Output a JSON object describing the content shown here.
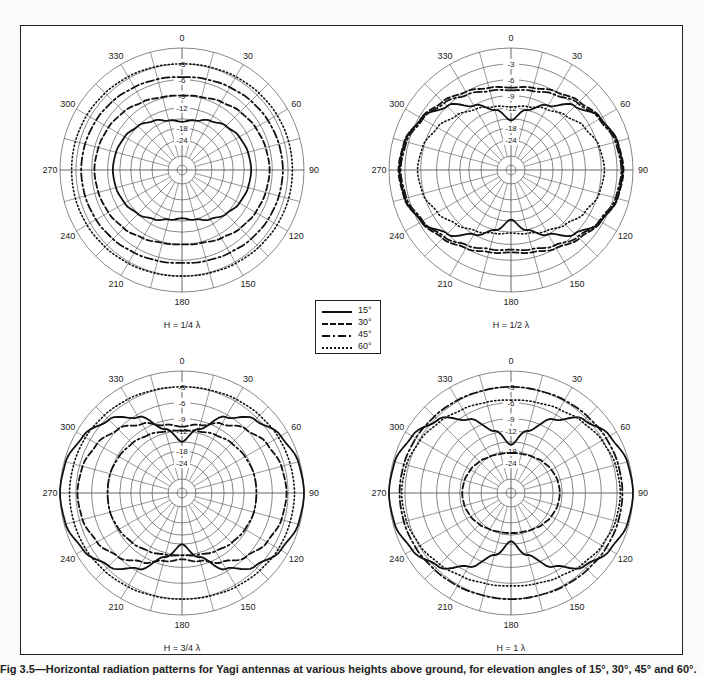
{
  "figure": {
    "caption": "Fig 3.5—Horizontal radiation patterns for Yagi antennas at various heights above ground, for elevation angles of 15°, 30°, 45° and 60°."
  },
  "legend": {
    "items": [
      {
        "label": "15°",
        "style": "solid"
      },
      {
        "label": "30°",
        "style": "dashed"
      },
      {
        "label": "45°",
        "style": "dashdot"
      },
      {
        "label": "60°",
        "style": "dotted"
      }
    ]
  },
  "axes": {
    "angle_labels": [
      "0",
      "30",
      "60",
      "90",
      "120",
      "150",
      "180",
      "210",
      "240",
      "270",
      "300",
      "330"
    ],
    "ring_labels": [
      "-3",
      "-6",
      "-9",
      "-12",
      "-18",
      "-24"
    ],
    "ring_db": [
      0,
      -3,
      -6,
      -9,
      -12,
      -15,
      -18,
      -24,
      -30,
      -40
    ],
    "ring_frac": [
      1.0,
      0.87,
      0.74,
      0.61,
      0.51,
      0.42,
      0.345,
      0.245,
      0.115,
      0.04
    ]
  },
  "chart_data": [
    {
      "type": "polar",
      "title": "H = 1/4 λ",
      "radial_unit": "dB",
      "radial_ticks": [
        0,
        -3,
        -6,
        -9,
        -12,
        -18,
        -24
      ],
      "angles_deg": [
        0,
        15,
        30,
        45,
        60,
        75,
        90
      ],
      "series": [
        {
          "name": "15°",
          "values_db": [
            -16,
            -15,
            -13.5,
            -12,
            -11,
            -10.5,
            -10.3
          ]
        },
        {
          "name": "30°",
          "values_db": [
            -9,
            -8.8,
            -8.2,
            -7.5,
            -7,
            -6.7,
            -6.5
          ]
        },
        {
          "name": "45°",
          "values_db": [
            -5.5,
            -5.3,
            -5,
            -4.6,
            -4.3,
            -4.1,
            -4
          ]
        },
        {
          "name": "60°",
          "values_db": [
            -3,
            -2.9,
            -2.7,
            -2.5,
            -2.3,
            -2.2,
            -2.2
          ]
        }
      ]
    },
    {
      "type": "polar",
      "title": "H = 1/2 λ",
      "radial_unit": "dB",
      "radial_ticks": [
        0,
        -3,
        -6,
        -9,
        -12,
        -18,
        -24
      ],
      "angles_deg": [
        0,
        15,
        30,
        45,
        60,
        75,
        90
      ],
      "series": [
        {
          "name": "15°",
          "values_db": [
            -15.5,
            -12,
            -9,
            -6,
            -3.5,
            -2.3,
            -2
          ]
        },
        {
          "name": "30°",
          "values_db": [
            -7.5,
            -7,
            -6,
            -4.8,
            -3.5,
            -2.2,
            -1.8
          ]
        },
        {
          "name": "45°",
          "values_db": [
            -8,
            -7.6,
            -6.6,
            -5.2,
            -3.8,
            -2.6,
            -2.2
          ]
        },
        {
          "name": "60°",
          "values_db": [
            -11.8,
            -11.2,
            -10,
            -8.5,
            -7,
            -5.8,
            -5.4
          ]
        }
      ]
    },
    {
      "type": "polar",
      "title": "H = 3/4 λ",
      "radial_unit": "dB",
      "radial_ticks": [
        0,
        -3,
        -6,
        -9,
        -12,
        -18,
        -24
      ],
      "angles_deg": [
        0,
        15,
        30,
        45,
        60,
        75,
        90
      ],
      "series": [
        {
          "name": "15°",
          "values_db": [
            -15,
            -11,
            -6.5,
            -3.5,
            -1.5,
            -0.3,
            0
          ]
        },
        {
          "name": "30°",
          "values_db": [
            -11,
            -10,
            -8,
            -6,
            -4.5,
            -3.6,
            -3.3
          ]
        },
        {
          "name": "45°",
          "values_db": [
            -12,
            -11.6,
            -10.8,
            -10,
            -9.4,
            -9,
            -9
          ]
        },
        {
          "name": "60°",
          "values_db": [
            -3,
            -2.9,
            -2.6,
            -2.3,
            -2,
            -1.9,
            -1.8
          ]
        }
      ]
    },
    {
      "type": "polar",
      "title": "H = 1 λ",
      "radial_unit": "dB",
      "radial_ticks": [
        0,
        -3,
        -6,
        -9,
        -12,
        -18,
        -24
      ],
      "angles_deg": [
        0,
        15,
        30,
        45,
        60,
        75,
        90
      ],
      "series": [
        {
          "name": "15°",
          "values_db": [
            -16,
            -11.5,
            -7,
            -3.5,
            -1.5,
            -0.3,
            0
          ]
        },
        {
          "name": "30°",
          "values_db": [
            -19,
            -18.8,
            -18,
            -17.2,
            -16.5,
            -16,
            -15.8
          ]
        },
        {
          "name": "45°",
          "values_db": [
            -3,
            -3,
            -2.8,
            -2.6,
            -2.3,
            -2.1,
            -2
          ]
        },
        {
          "name": "60°",
          "values_db": [
            -5.5,
            -5.3,
            -4.8,
            -4,
            -3.2,
            -2.6,
            -2.4
          ]
        }
      ]
    }
  ]
}
